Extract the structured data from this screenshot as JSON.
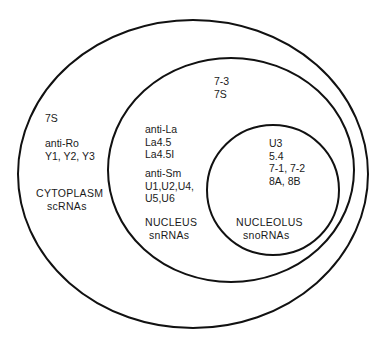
{
  "diagram": {
    "regions": [
      {
        "id": "cytoplasm",
        "name": "CYTOPLASM",
        "class": "scRNAs",
        "antigroups": [
          {
            "label": "",
            "items": [
              "7S"
            ]
          },
          {
            "label": "anti-Ro",
            "items": [
              "Y1, Y2, Y3"
            ]
          }
        ]
      },
      {
        "id": "nucleus",
        "name": "NUCLEUS",
        "class": "snRNAs",
        "top_items": [
          "7-3",
          "7S"
        ],
        "antigroups": [
          {
            "label": "anti-La",
            "items": [
              "La4.5",
              "La4.5I"
            ]
          },
          {
            "label": "anti-Sm",
            "items": [
              "U1,U2,U4,",
              "U5,U6"
            ]
          }
        ]
      },
      {
        "id": "nucleolus",
        "name": "NUCLEOLUS",
        "class": "snoRNAs",
        "items": [
          "U3",
          "5.4",
          "7-1, 7-2",
          "8A, 8B"
        ]
      }
    ],
    "stroke_color": "#111111",
    "background": "#ffffff"
  }
}
